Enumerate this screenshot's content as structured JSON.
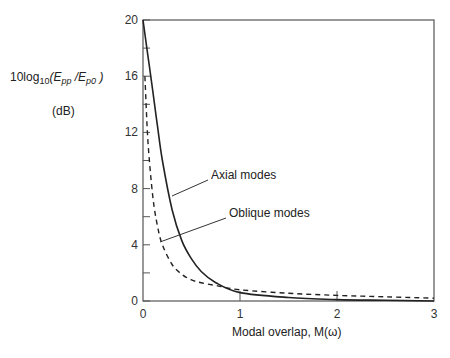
{
  "chart_data": {
    "type": "line",
    "title": "",
    "xlabel": "Modal overlap,  M(ω)",
    "ylabel": "10log10(Epp/Ep0)",
    "ylabel_unit": "(dB)",
    "xlim": [
      0,
      3
    ],
    "ylim": [
      0,
      20
    ],
    "x_ticks": [
      0,
      1,
      2,
      3
    ],
    "y_ticks": [
      0,
      4,
      8,
      12,
      16,
      20
    ],
    "y_minor_ticks": [
      2,
      6,
      10,
      14,
      18
    ],
    "grid": false,
    "legend": "none (inline annotations)",
    "series": [
      {
        "name": "Axial modes",
        "style": "solid",
        "x": [
          0.0,
          0.05,
          0.1,
          0.15,
          0.2,
          0.3,
          0.4,
          0.5,
          0.6,
          0.75,
          1.0,
          1.5,
          2.0,
          2.5,
          3.0
        ],
        "y": [
          20.0,
          17.5,
          15.0,
          12.4,
          10.0,
          6.5,
          4.3,
          3.0,
          2.1,
          1.3,
          0.6,
          0.25,
          0.1,
          0.05,
          0.0
        ]
      },
      {
        "name": "Oblique modes",
        "style": "dashed",
        "x": [
          0.02,
          0.05,
          0.1,
          0.15,
          0.2,
          0.3,
          0.4,
          0.5,
          0.6,
          0.75,
          1.0,
          1.5,
          2.0,
          2.5,
          3.0
        ],
        "y": [
          16.0,
          11.5,
          7.5,
          5.3,
          4.0,
          2.6,
          1.9,
          1.5,
          1.3,
          1.1,
          0.8,
          0.55,
          0.4,
          0.3,
          0.2
        ]
      }
    ],
    "annotations": [
      {
        "text": "Axial modes",
        "points_to": {
          "x": 0.25,
          "y": 8.2
        }
      },
      {
        "text": "Oblique modes",
        "points_to": {
          "x": 0.18,
          "y": 4.2
        }
      }
    ]
  },
  "labels": {
    "ylabel_prefix": "10log",
    "ylabel_sub": "10",
    "ylabel_open": "(",
    "ylabel_E1": "E",
    "ylabel_E1_sub": "pp",
    "ylabel_slash": " /",
    "ylabel_E2": "E",
    "ylabel_E2_sub": "p0",
    "ylabel_close": " )",
    "yunit": "(dB)",
    "xlabel": "Modal overlap,  M(ω)",
    "annot_axial": "Axial modes",
    "annot_oblique": "Oblique modes"
  }
}
